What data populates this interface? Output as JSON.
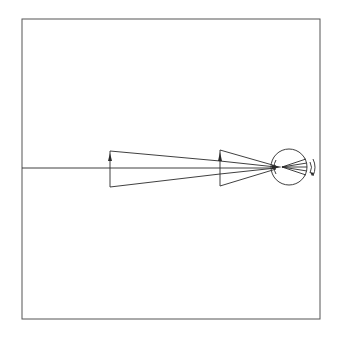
{
  "diagram": {
    "type": "optics-ray-diagram",
    "colors": {
      "line": "#2a2a2a",
      "frame": "#555555",
      "background": "#ffffff"
    },
    "elements": {
      "optical_axis": "horizontal axis line",
      "object_near": "upright arrow (far object)",
      "object_far": "upright arrow (near object)",
      "eye": "circular eye with converging rays to retina",
      "rotation_marks": "curved motion arcs beside eye"
    }
  }
}
